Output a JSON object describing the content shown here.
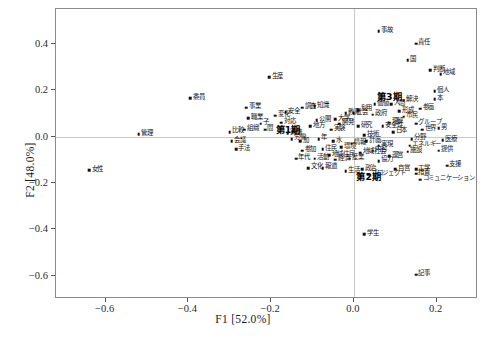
{
  "chart_data": {
    "type": "scatter",
    "title": "",
    "xlabel": "F1 [52.0%]",
    "ylabel": "F2 [48.0%]",
    "xlim": [
      -0.72,
      0.3
    ],
    "ylim": [
      -0.7,
      0.55
    ],
    "xticks": [
      "-0.6",
      "-0.4",
      "-0.2",
      "0.0",
      "0.2"
    ],
    "xtick_values": [
      -0.6,
      -0.4,
      -0.2,
      0.0,
      0.2
    ],
    "yticks": [
      "0.4",
      "0.2",
      "0.0",
      "-0.2",
      "-0.4",
      "-0.6"
    ],
    "ytick_values": [
      0.4,
      0.2,
      0.0,
      -0.2,
      -0.4,
      -0.6
    ],
    "grid": false,
    "reference_lines": {
      "x": 0.0,
      "y": 0.0,
      "color": "#c9c9c9"
    },
    "marker_color": "#111111",
    "legend": "none",
    "group_labels": [
      {
        "label": "第1期",
        "x": -0.155,
        "y": 0.035
      },
      {
        "label": "第2期",
        "x": 0.04,
        "y": -0.165
      },
      {
        "label": "第3期",
        "x": 0.09,
        "y": 0.18
      }
    ],
    "points": [
      {
        "label": "女性",
        "x": -0.64,
        "y": -0.145
      },
      {
        "label": "管理",
        "x": -0.52,
        "y": 0.01
      },
      {
        "label": "委員",
        "x": -0.395,
        "y": 0.165
      },
      {
        "label": "生産",
        "x": -0.205,
        "y": 0.255
      },
      {
        "label": "事業",
        "x": -0.26,
        "y": 0.125
      },
      {
        "label": "職業",
        "x": -0.255,
        "y": 0.08
      },
      {
        "label": "組織",
        "x": -0.265,
        "y": 0.03
      },
      {
        "label": "比較",
        "x": -0.3,
        "y": 0.02
      },
      {
        "label": "会議",
        "x": -0.295,
        "y": -0.02
      },
      {
        "label": "手法",
        "x": -0.285,
        "y": -0.055
      },
      {
        "label": "子",
        "x": -0.225,
        "y": 0.055
      },
      {
        "label": "間",
        "x": -0.215,
        "y": 0.03
      },
      {
        "label": "変化",
        "x": -0.19,
        "y": 0.09
      },
      {
        "label": "安全",
        "x": -0.165,
        "y": 0.105
      },
      {
        "label": "対応",
        "x": -0.175,
        "y": 0.06
      },
      {
        "label": "実施",
        "x": -0.16,
        "y": 0.015
      },
      {
        "label": "労働",
        "x": -0.15,
        "y": -0.01
      },
      {
        "label": "加",
        "x": -0.13,
        "y": -0.02
      },
      {
        "label": "年代",
        "x": -0.14,
        "y": -0.095
      },
      {
        "label": "参加",
        "x": -0.125,
        "y": -0.06
      },
      {
        "label": "文化",
        "x": -0.11,
        "y": -0.135
      },
      {
        "label": "報道",
        "x": -0.075,
        "y": -0.135
      },
      {
        "label": "政治",
        "x": 0.02,
        "y": -0.14
      },
      {
        "label": "生活",
        "x": -0.02,
        "y": -0.15
      },
      {
        "label": "プロジェクト",
        "x": 0.035,
        "y": -0.165
      },
      {
        "label": "自営",
        "x": 0.1,
        "y": -0.14
      },
      {
        "label": "工学",
        "x": 0.15,
        "y": -0.14
      },
      {
        "label": "措置",
        "x": 0.15,
        "y": -0.16
      },
      {
        "label": "コミュニケーション",
        "x": 0.16,
        "y": -0.185
      },
      {
        "label": "支援",
        "x": 0.225,
        "y": -0.125
      },
      {
        "label": "学生",
        "x": 0.025,
        "y": -0.42
      },
      {
        "label": "記事",
        "x": 0.15,
        "y": -0.595
      },
      {
        "label": "事故",
        "x": 0.06,
        "y": 0.455
      },
      {
        "label": "責任",
        "x": 0.15,
        "y": 0.4
      },
      {
        "label": "国",
        "x": 0.13,
        "y": 0.33
      },
      {
        "label": "判断",
        "x": 0.185,
        "y": 0.285
      },
      {
        "label": "地域",
        "x": 0.21,
        "y": 0.27
      },
      {
        "label": "個人",
        "x": 0.195,
        "y": 0.195
      },
      {
        "label": "本",
        "x": 0.195,
        "y": 0.16
      },
      {
        "label": "人間",
        "x": 0.09,
        "y": 0.14
      },
      {
        "label": "価値",
        "x": 0.05,
        "y": 0.14
      },
      {
        "label": "政府",
        "x": 0.045,
        "y": 0.095
      },
      {
        "label": "利用",
        "x": 0.01,
        "y": 0.115
      },
      {
        "label": "社会",
        "x": 0.0,
        "y": 0.1
      },
      {
        "label": "教育",
        "x": -0.02,
        "y": 0.1
      },
      {
        "label": "理解",
        "x": 0.085,
        "y": 0.06
      },
      {
        "label": "安全性",
        "x": 0.07,
        "y": 0.045
      },
      {
        "label": "日本",
        "x": 0.095,
        "y": 0.02
      },
      {
        "label": "男",
        "x": 0.205,
        "y": 0.035
      },
      {
        "label": "世界",
        "x": 0.165,
        "y": 0.03
      },
      {
        "label": "グループ",
        "x": 0.15,
        "y": 0.055
      },
      {
        "label": "分野",
        "x": 0.14,
        "y": -0.01
      },
      {
        "label": "エネルギー",
        "x": 0.135,
        "y": -0.04
      },
      {
        "label": "医療",
        "x": 0.215,
        "y": -0.015
      },
      {
        "label": "提供",
        "x": 0.205,
        "y": -0.06
      },
      {
        "label": "施設",
        "x": 0.13,
        "y": -0.065
      },
      {
        "label": "実現",
        "x": 0.06,
        "y": -0.04
      },
      {
        "label": "内容",
        "x": 0.045,
        "y": -0.06
      },
      {
        "label": "計画",
        "x": 0.03,
        "y": -0.02
      },
      {
        "label": "地域社会",
        "x": 0.015,
        "y": -0.07
      },
      {
        "label": "情報",
        "x": -0.005,
        "y": -0.03
      },
      {
        "label": "環境",
        "x": -0.03,
        "y": -0.045
      },
      {
        "label": "水",
        "x": -0.05,
        "y": -0.02
      },
      {
        "label": "地域住民",
        "x": -0.06,
        "y": -0.08
      },
      {
        "label": "住民",
        "x": -0.075,
        "y": -0.055
      },
      {
        "label": "活動",
        "x": -0.095,
        "y": -0.095
      },
      {
        "label": "経済",
        "x": -0.045,
        "y": -0.1
      },
      {
        "label": "産業",
        "x": -0.01,
        "y": -0.095
      },
      {
        "label": "技術",
        "x": 0.025,
        "y": 0.005
      },
      {
        "label": "研究",
        "x": 0.01,
        "y": 0.045
      },
      {
        "label": "開発",
        "x": -0.035,
        "y": 0.055
      },
      {
        "label": "実験",
        "x": -0.055,
        "y": 0.03
      },
      {
        "label": "年",
        "x": -0.085,
        "y": -0.01
      },
      {
        "label": "地方",
        "x": -0.105,
        "y": 0.045
      },
      {
        "label": "公開",
        "x": -0.09,
        "y": 0.07
      },
      {
        "label": "大学",
        "x": -0.045,
        "y": 0.075
      },
      {
        "label": "調査",
        "x": -0.125,
        "y": 0.125
      },
      {
        "label": "知識",
        "x": -0.095,
        "y": 0.13
      },
      {
        "label": "市民",
        "x": 0.12,
        "y": 0.085
      },
      {
        "label": "形成",
        "x": 0.11,
        "y": 0.11
      },
      {
        "label": "参画",
        "x": 0.16,
        "y": 0.12
      },
      {
        "label": "解決",
        "x": 0.12,
        "y": 0.155
      },
      {
        "label": "協力",
        "x": 0.06,
        "y": -0.105
      },
      {
        "label": "運営",
        "x": 0.085,
        "y": -0.085
      }
    ]
  },
  "caption": "",
  "axes": {
    "xlabel": "F1 [52.0%]",
    "ylabel": "F2 [48.0%]"
  }
}
